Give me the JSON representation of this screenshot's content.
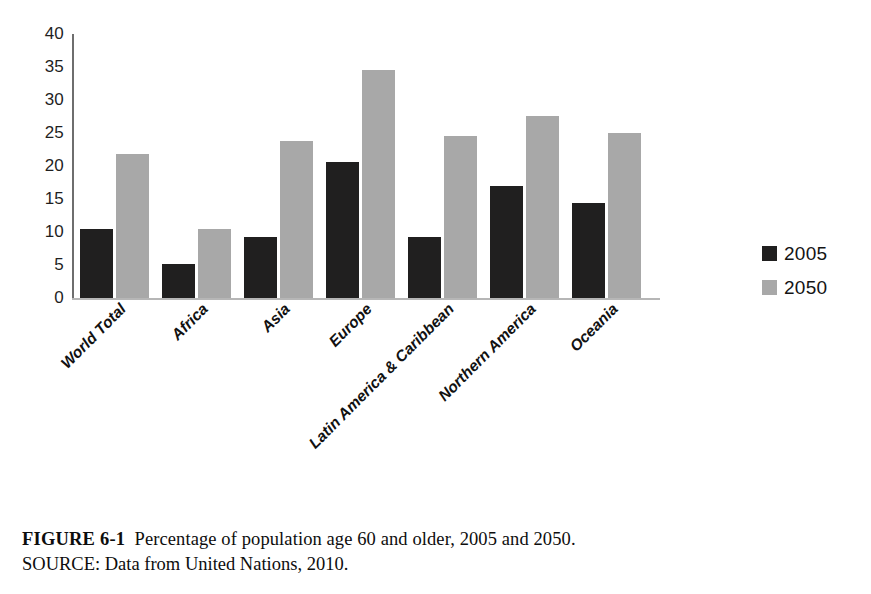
{
  "chart_data": {
    "type": "bar",
    "title": "",
    "subtitle": "",
    "xlabel": "",
    "ylabel": "",
    "ylim": [
      0,
      40
    ],
    "ytick_labels": [
      "40",
      "35",
      "30",
      "25",
      "20",
      "15",
      "10",
      "5",
      "0"
    ],
    "ytick_values": [
      40,
      35,
      30,
      25,
      20,
      15,
      10,
      5,
      0
    ],
    "grid": false,
    "legend_position": "right",
    "xtick_rotation": -45,
    "categories": [
      "World Total",
      "Africa",
      "Asia",
      "Europe",
      "Latin America & Caribbean",
      "Northern America",
      "Oceania"
    ],
    "series": [
      {
        "name": "2005",
        "color": "#201f1f",
        "values": [
          10.4,
          5.2,
          9.3,
          20.6,
          9.3,
          16.9,
          14.4
        ]
      },
      {
        "name": "2050",
        "color": "#a8a8a8",
        "values": [
          21.8,
          10.4,
          23.8,
          34.6,
          24.5,
          27.6,
          25.0
        ]
      }
    ]
  },
  "legend": {
    "items": [
      {
        "label": "2005",
        "color": "#201f1f"
      },
      {
        "label": "2050",
        "color": "#a8a8a8"
      }
    ]
  },
  "caption": {
    "figure_number": "FIGURE 6-1",
    "description": "Percentage of population age 60 and older, 2005 and 2050.",
    "source": "SOURCE: Data from United Nations, 2010."
  },
  "colors": {
    "series_2005": "#201f1f",
    "series_2050": "#a8a8a8",
    "axis": "#6e6e6e",
    "baseline": "#b6b6b6",
    "text": "#1a1a1a",
    "background": "#ffffff"
  }
}
